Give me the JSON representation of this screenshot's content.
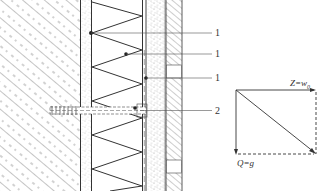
{
  "diagram": {
    "type": "construction-section-with-force-diagram",
    "layers": [
      {
        "id": "concrete-wall",
        "pattern": "diagonal-hatch-dashed"
      },
      {
        "id": "adhesive-layer",
        "pattern": "stipple"
      },
      {
        "id": "insulation",
        "pattern": "zigzag"
      },
      {
        "id": "reinforcement-mesh",
        "pattern": "double-line"
      },
      {
        "id": "render",
        "pattern": "stipple"
      },
      {
        "id": "brick-cladding",
        "pattern": "diagonal-hatch"
      }
    ],
    "callouts": [
      {
        "label": "1",
        "y": 33
      },
      {
        "label": "1",
        "y": 54
      },
      {
        "label": "1",
        "y": 78
      },
      {
        "label": "2",
        "y": 111
      }
    ],
    "force_diagram": {
      "horizontal_label_main": "Z=w",
      "horizontal_label_sub": "0",
      "vertical_label": "Q=g"
    },
    "colors": {
      "line": "#333333",
      "hatch": "#555555",
      "stipple": "#777777"
    }
  }
}
